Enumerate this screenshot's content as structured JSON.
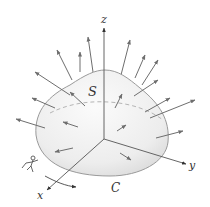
{
  "diagram": {
    "type": "stokes-theorem-surface",
    "labels": {
      "surface": "S",
      "curve": "C",
      "x_axis": "x",
      "y_axis": "y",
      "z_axis": "z"
    },
    "colors": {
      "surface_fill": "#eeeeee",
      "surface_edge": "#9a9a9a",
      "arrow": "#6e6e6e",
      "axis": "#555555",
      "text": "#333333"
    }
  }
}
